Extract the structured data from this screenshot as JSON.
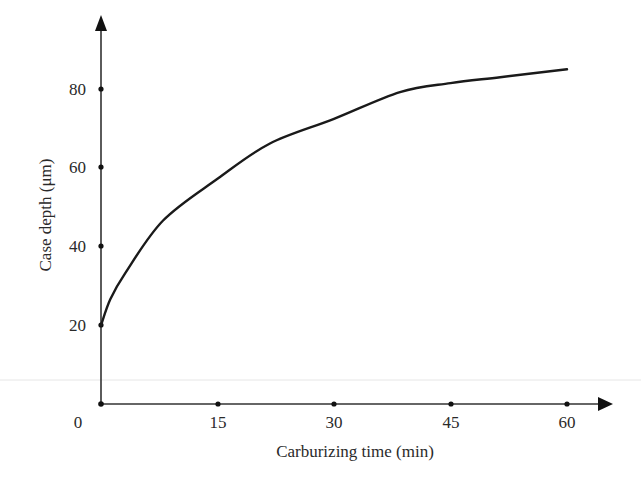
{
  "chart_data": {
    "type": "line",
    "title": "",
    "xlabel": "Carburizing time (min)",
    "ylabel": "Case depth (μm)",
    "xlim": [
      0,
      62
    ],
    "ylim": [
      0,
      95
    ],
    "grid": false,
    "legend": null,
    "x_ticks": [
      "0",
      "15",
      "30",
      "45",
      "60"
    ],
    "y_ticks": [
      "20",
      "40",
      "60",
      "80"
    ],
    "series": [
      {
        "name": "Case depth",
        "x": [
          0,
          1.2,
          3.1,
          8,
          15,
          21.7,
          30,
          38.5,
          45,
          51.4,
          60
        ],
        "values": [
          20,
          26.6,
          33.2,
          46.6,
          57.2,
          66.1,
          72.4,
          79.2,
          81.5,
          83,
          85
        ]
      }
    ]
  },
  "axes": {
    "x_label": "Carburizing time (min)",
    "y_label": "Case depth (μm)",
    "origin_label": "0",
    "x_tick_labels": [
      "15",
      "30",
      "45",
      "60"
    ],
    "y_tick_labels": [
      "20",
      "40",
      "60",
      "80"
    ]
  }
}
